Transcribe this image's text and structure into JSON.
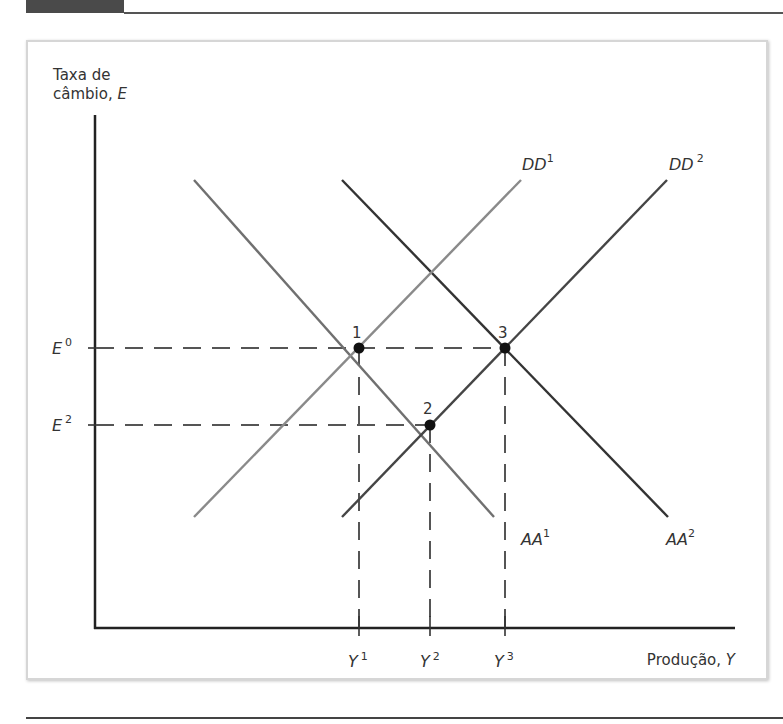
{
  "figure": {
    "y_axis_label_line1": "Taxa de",
    "y_axis_label_line2_text": "câmbio, ",
    "y_axis_label_line2_var": "E",
    "x_axis_label_text": "Produção, ",
    "x_axis_label_var": "Y",
    "curves": [
      {
        "name": "AA",
        "sup": "1",
        "color": "#707070",
        "from": [
          194,
          180
        ],
        "to": [
          494,
          517
        ]
      },
      {
        "name": "AA",
        "sup": "2",
        "color": "#333333",
        "from": [
          342,
          180
        ],
        "to": [
          668,
          517
        ]
      },
      {
        "name": "DD",
        "sup": "1",
        "color": "#8a8a8a",
        "from": [
          194,
          517
        ],
        "to": [
          521,
          180
        ]
      },
      {
        "name": "DD",
        "sup": "2",
        "color": "#454545",
        "from": [
          342,
          517
        ],
        "to": [
          667,
          180
        ]
      }
    ],
    "equilibrium_points": [
      {
        "label": "1",
        "x": 359,
        "y": 348
      },
      {
        "label": "2",
        "x": 430,
        "y": 425
      },
      {
        "label": "3",
        "x": 505,
        "y": 348
      }
    ],
    "y_ticks": [
      {
        "var": "E",
        "sup": "0",
        "y": 348
      },
      {
        "var": "E",
        "sup": "2",
        "y": 425
      }
    ],
    "x_ticks": [
      {
        "var": "Y",
        "sup": "1",
        "x": 359
      },
      {
        "var": "Y",
        "sup": "2",
        "x": 430
      },
      {
        "var": "Y",
        "sup": "3",
        "x": 505
      }
    ],
    "labels": {
      "AA1": "AA",
      "AA1_sup": "1",
      "AA2": "AA",
      "AA2_sup": "2",
      "DD1": "DD",
      "DD1_sup": "1",
      "DD2": "DD",
      "DD2_sup": "2",
      "E0": "E",
      "E0_sup": "0",
      "E2": "E",
      "E2_sup": "2",
      "Y1": "Y",
      "Y1_sup": "1",
      "Y2": "Y",
      "Y2_sup": "2",
      "Y3": "Y",
      "Y3_sup": "3",
      "p1": "1",
      "p2": "2",
      "p3": "3"
    }
  }
}
